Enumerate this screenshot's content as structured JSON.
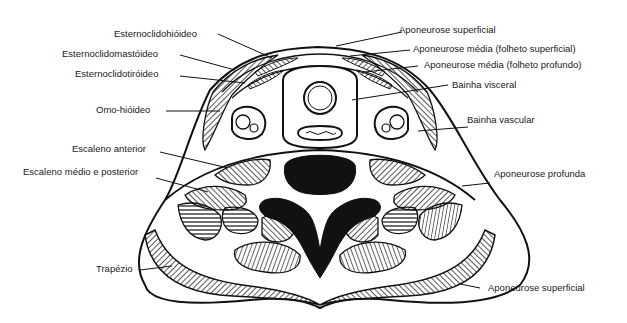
{
  "diagram": {
    "ink_color": "#111111",
    "background_color": "#ffffff",
    "labels_left": [
      {
        "id": "esternoclidohioideo",
        "text": "Esternoclidohióideo"
      },
      {
        "id": "esternoclidomastoideo",
        "text": "Esternoclidomastóideo"
      },
      {
        "id": "esternoclidotiroideo",
        "text": "Esternoclidotiróideo"
      },
      {
        "id": "omo-hioideo",
        "text": "Omo-hióideo"
      },
      {
        "id": "escaleno-anterior",
        "text": "Escaleno anterior"
      },
      {
        "id": "escaleno-medio-posterior",
        "text": "Escaleno médio e posterior"
      },
      {
        "id": "trapezio",
        "text": "Trapézio"
      }
    ],
    "labels_right": [
      {
        "id": "aponeurose-superficial-top",
        "text": "Aponeurose superficial"
      },
      {
        "id": "aponeurose-media-superficial",
        "text": "Aponeurose média (folheto superficial)"
      },
      {
        "id": "aponeurose-media-profundo",
        "text": "Aponeurose média (folheto profundo)"
      },
      {
        "id": "bainha-visceral",
        "text": "Bainha visceral"
      },
      {
        "id": "bainha-vascular",
        "text": "Bainha vascular"
      },
      {
        "id": "aponeurose-profunda",
        "text": "Aponeurose profunda"
      },
      {
        "id": "aponeurose-superficial-bottom",
        "text": "Aponeurose superficial"
      }
    ]
  }
}
